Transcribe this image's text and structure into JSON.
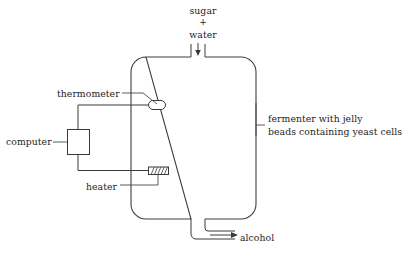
{
  "diagram": {
    "title": "Fermenter with jelly beads containing yeast cells",
    "background_color": "#ffffff",
    "line_color": "#3a3a3a",
    "text_color": "#1d1d1d",
    "labels": {
      "inlet_substrate": "sugar",
      "inlet_plus": "+",
      "inlet_solvent": "water",
      "thermometer": "thermometer",
      "computer": "computer",
      "heater": "heater",
      "outlet_product": "alcohol",
      "vessel_line1": "fermenter with jelly",
      "vessel_line2": "beads containing yeast cells"
    },
    "icons": {
      "inlet_arrow": "arrow-down-icon",
      "outlet_arrow": "arrow-right-icon",
      "thermometer_probe": "thermometer-probe-icon",
      "heater_element": "heating-element-icon",
      "computer_unit": "computer-box-icon"
    }
  }
}
